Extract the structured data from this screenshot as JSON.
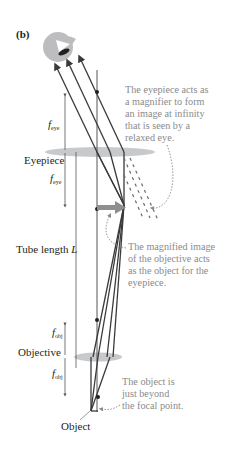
{
  "figure": {
    "panel_label": "(b)",
    "labels": {
      "f_eye_top": "f",
      "f_eye_top_sub": "eye",
      "eyepiece": "Eyepiece",
      "f_eye_bottom": "f",
      "f_eye_bottom_sub": "eye",
      "tube_length": "Tube length ",
      "tube_length_var": "L",
      "f_obj_top": "f",
      "f_obj_top_sub": "obj",
      "objective": "Objective",
      "f_obj_bottom": "f",
      "f_obj_bottom_sub": "obj",
      "object": "Object"
    },
    "annotations": {
      "eyepiece_note": [
        "The eyepiece acts as",
        "a magnifier to form",
        "an image at infinity",
        "that is seen by a",
        "relaxed eye."
      ],
      "image_note": [
        "The magnified image",
        "of the objective acts",
        "as the object for the",
        "eyepiece."
      ],
      "object_note": [
        "The object is",
        "just beyond",
        "the focal point."
      ]
    },
    "colors": {
      "ray": "#3a3a3c",
      "lens": "#c8c9cb",
      "note_text": "#8a8a8c",
      "image_arrow": "#8e8f91",
      "eye": "#bdbdbf"
    }
  }
}
